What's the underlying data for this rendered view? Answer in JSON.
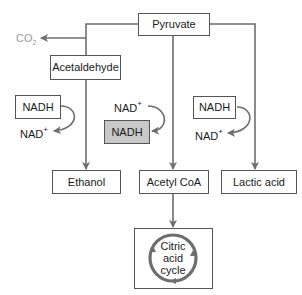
{
  "diagram": {
    "nodes": {
      "pyruvate": "Pyruvate",
      "acetaldehyde": "Acetaldehyde",
      "ethanol": "Ethanol",
      "acetyl_coa": "Acetyl CoA",
      "lactic_acid": "Lactic acid",
      "citric_acid_cycle": [
        "Citric",
        "acid",
        "cycle"
      ]
    },
    "byproducts": {
      "co2": {
        "base": "CO",
        "sub": "2"
      }
    },
    "cofactors": {
      "left": {
        "in": "NADH",
        "out_base": "NAD",
        "out_sup": "+"
      },
      "middle": {
        "in_base": "NAD",
        "in_sup": "+",
        "out": "NADH"
      },
      "right": {
        "in": "NADH",
        "out_base": "NAD",
        "out_sup": "+"
      }
    },
    "colors": {
      "line": "#6e6e6e",
      "box_border": "#555555",
      "highlight_box": "#c8c8c8",
      "co2_text": "#9a9a9a"
    }
  }
}
